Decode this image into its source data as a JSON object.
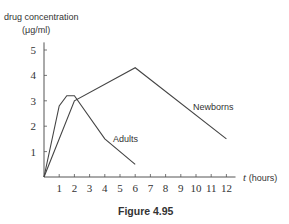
{
  "chart_data": {
    "type": "line",
    "title": "",
    "caption": "Figure 4.95",
    "ylabel_line1": "drug concentration",
    "ylabel_line2": "(μg/ml)",
    "xlabel_var": "t",
    "xlabel_unit": "(hours)",
    "xlim": [
      0,
      12
    ],
    "ylim": [
      0,
      5
    ],
    "xticks": [
      1,
      2,
      3,
      4,
      5,
      6,
      7,
      8,
      9,
      10,
      11,
      12
    ],
    "yticks": [
      1,
      2,
      3,
      4,
      5
    ],
    "grid": false,
    "series": [
      {
        "name": "Adults",
        "x": [
          0,
          1,
          1.5,
          2,
          4,
          6
        ],
        "y": [
          0,
          2.8,
          3.2,
          3.2,
          1.5,
          0.5
        ]
      },
      {
        "name": "Newborns",
        "x": [
          0,
          2,
          6,
          12
        ],
        "y": [
          0,
          3.0,
          4.3,
          1.5
        ]
      }
    ]
  }
}
